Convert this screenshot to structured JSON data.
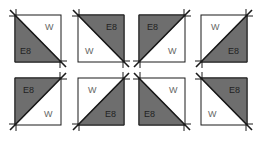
{
  "colors": {
    "dark": "#6e6e6e",
    "light": "#ffffff",
    "stroke": "#1a1a1a"
  },
  "blocks": [
    {
      "row": 1,
      "col": 1,
      "x": 15,
      "y": 15,
      "diagonal": "tl-br",
      "dark_side": "bottom-left",
      "dark_label": "E8",
      "light_label": "W"
    },
    {
      "row": 1,
      "col": 2,
      "x": 78,
      "y": 15,
      "diagonal": "tl-br",
      "dark_side": "top-right",
      "dark_label": "E8",
      "light_label": "W"
    },
    {
      "row": 1,
      "col": 3,
      "x": 139,
      "y": 15,
      "diagonal": "bl-tr",
      "dark_side": "top-left",
      "dark_label": "E8",
      "light_label": "W"
    },
    {
      "row": 1,
      "col": 4,
      "x": 201,
      "y": 15,
      "diagonal": "bl-tr",
      "dark_side": "bottom-right",
      "dark_label": "E8",
      "light_label": "W"
    },
    {
      "row": 2,
      "col": 1,
      "x": 15,
      "y": 78,
      "diagonal": "bl-tr",
      "dark_side": "top-left",
      "dark_label": "E8",
      "light_label": "W"
    },
    {
      "row": 2,
      "col": 2,
      "x": 78,
      "y": 78,
      "diagonal": "bl-tr",
      "dark_side": "bottom-right",
      "dark_label": "E8",
      "light_label": "W"
    },
    {
      "row": 2,
      "col": 3,
      "x": 139,
      "y": 78,
      "diagonal": "tl-br",
      "dark_side": "bottom-left",
      "dark_label": "E8",
      "light_label": "W"
    },
    {
      "row": 2,
      "col": 4,
      "x": 201,
      "y": 78,
      "diagonal": "tl-br",
      "dark_side": "top-right",
      "dark_label": "E8",
      "light_label": "W"
    }
  ]
}
